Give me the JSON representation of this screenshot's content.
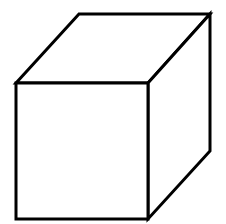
{
  "diagram": {
    "title": "Cube",
    "type": "wireframe-cube",
    "stroke_color": "#000000",
    "background_color": "#ffffff",
    "stroke_width": 3,
    "faces": {
      "front": [
        [
          16,
          83
        ],
        [
          148,
          83
        ],
        [
          148,
          219
        ],
        [
          16,
          219
        ]
      ],
      "top": [
        [
          16,
          83
        ],
        [
          79,
          14
        ],
        [
          210,
          14
        ],
        [
          148,
          83
        ]
      ],
      "right": [
        [
          148,
          83
        ],
        [
          210,
          14
        ],
        [
          210,
          151
        ],
        [
          148,
          219
        ]
      ]
    }
  }
}
